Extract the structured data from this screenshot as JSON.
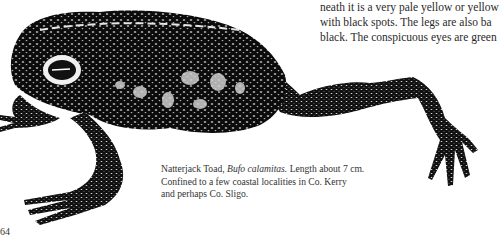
{
  "body_text": {
    "lines": [
      "neath it is a very pale yellow or yellow",
      "with black spots. The legs are also ba",
      "black. The conspicuous eyes are green"
    ]
  },
  "illustration": {
    "subject": "Natterjack Toad"
  },
  "caption": {
    "common_name": "Natterjack Toad, ",
    "scientific_name": "Bufo calamitas.",
    "line1_rest": " Length about 7 cm.",
    "line2": "Confined to a few coastal localities in Co. Kerry",
    "line3": "and perhaps Co. Sligo."
  },
  "page_number": "64"
}
